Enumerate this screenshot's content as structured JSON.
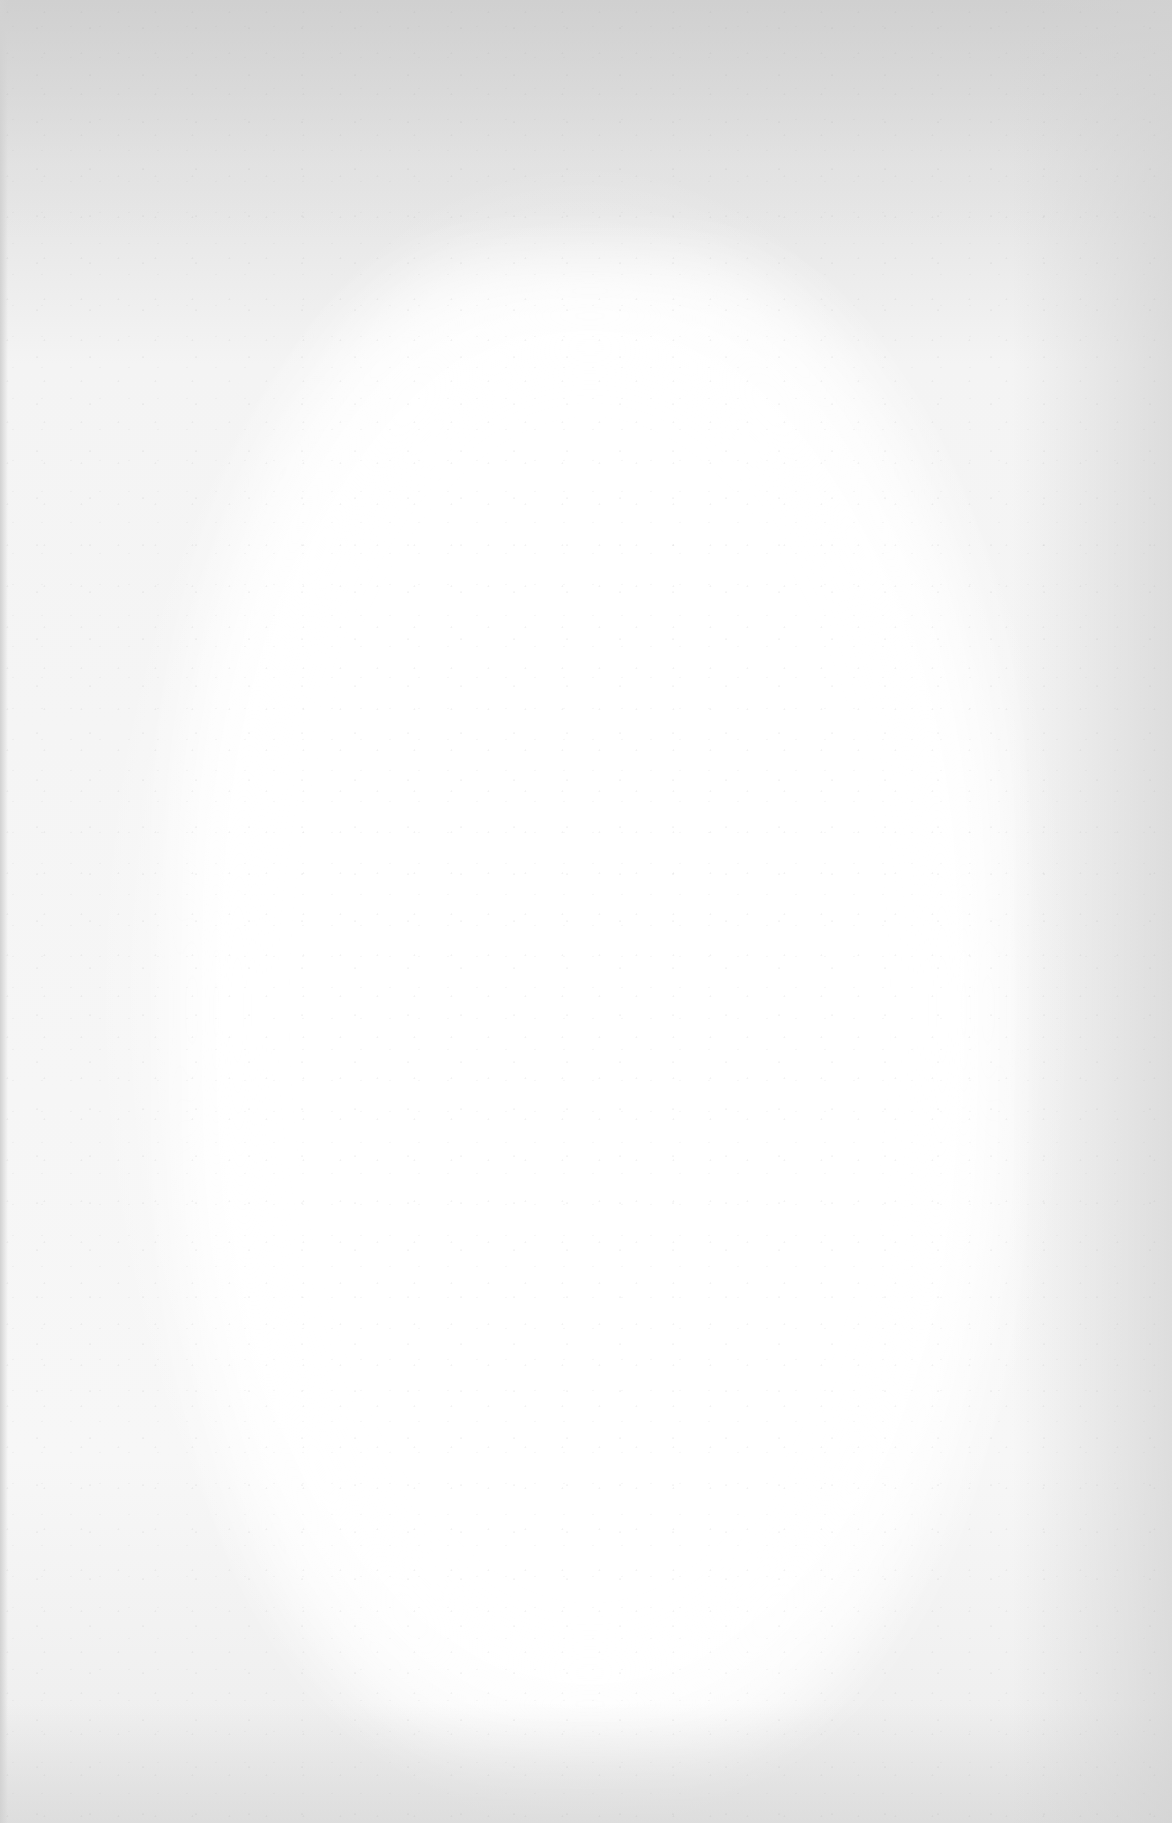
{
  "document": {
    "type": "blank-scanned-page",
    "content": [],
    "colors": {
      "paper_center": "#ffffff",
      "paper_edge": "#e2e2e2",
      "top_band": "#d8d8d8"
    }
  }
}
